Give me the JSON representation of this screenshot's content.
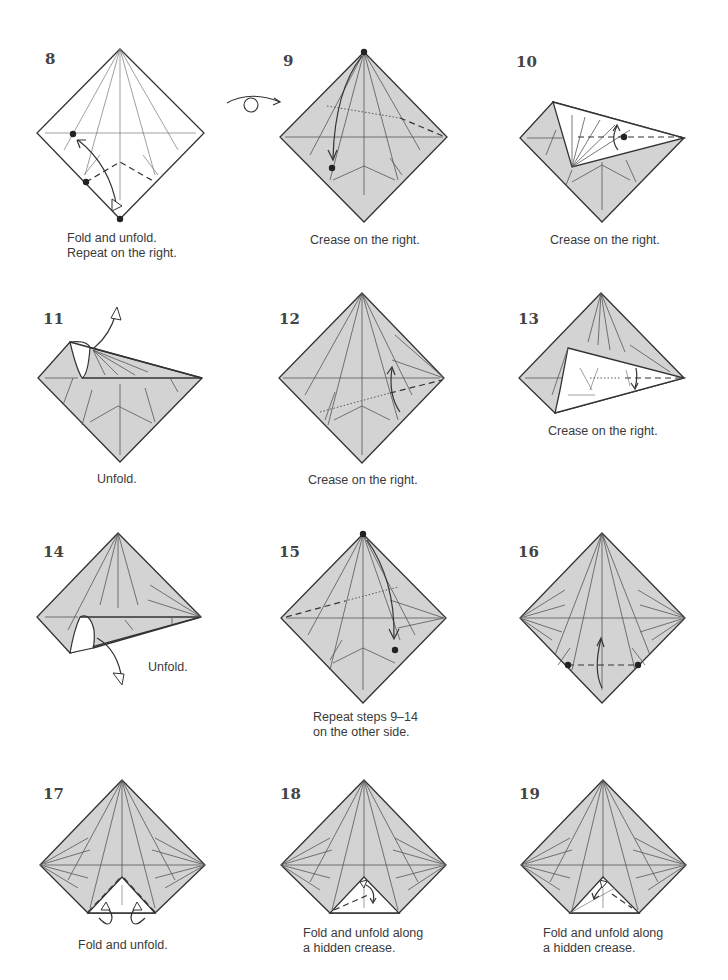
{
  "page": {
    "background": "#ffffff",
    "paper_color": "#d3d3d3",
    "line_color": "#333333"
  },
  "steps": [
    {
      "number": "8",
      "caption": [
        "Fold and unfold.",
        "Repeat on the right."
      ]
    },
    {
      "number": "9",
      "caption": [
        "Crease on the right."
      ],
      "symbol": "turn-over-icon"
    },
    {
      "number": "10",
      "caption": [
        "Crease on the right."
      ]
    },
    {
      "number": "11",
      "caption": [
        "Unfold."
      ]
    },
    {
      "number": "12",
      "caption": [
        "Crease on the right."
      ]
    },
    {
      "number": "13",
      "caption": [
        "Crease on the right."
      ]
    },
    {
      "number": "14",
      "caption": [
        "Unfold."
      ]
    },
    {
      "number": "15",
      "caption": [
        "Repeat steps 9–14",
        "on the other side."
      ]
    },
    {
      "number": "16",
      "caption": []
    },
    {
      "number": "17",
      "caption": [
        "Fold and unfold."
      ]
    },
    {
      "number": "18",
      "caption": [
        "Fold and unfold along",
        "a hidden crease."
      ]
    },
    {
      "number": "19",
      "caption": [
        "Fold and unfold along",
        "a hidden crease."
      ]
    }
  ]
}
